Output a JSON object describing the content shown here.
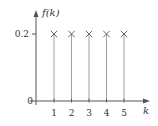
{
  "chart_data": {
    "type": "stem",
    "title": "",
    "xlabel": "k",
    "ylabel": "f(k)",
    "origin_label": "0",
    "x": [
      1,
      2,
      3,
      4,
      5
    ],
    "values": [
      0.2,
      0.2,
      0.2,
      0.2,
      0.2
    ],
    "x_tick_labels": [
      "1",
      "2",
      "3",
      "4",
      "5"
    ],
    "y_tick_labels": [
      "0.2"
    ],
    "y_ticks": [
      0.2
    ],
    "marker": "x",
    "grid": false,
    "legend": null,
    "xlim": [
      0,
      5.8
    ],
    "ylim": [
      0,
      0.26
    ]
  },
  "colors": {
    "axis": "#555555",
    "stem": "#888888",
    "marker": "#555555",
    "text": "#333333"
  }
}
